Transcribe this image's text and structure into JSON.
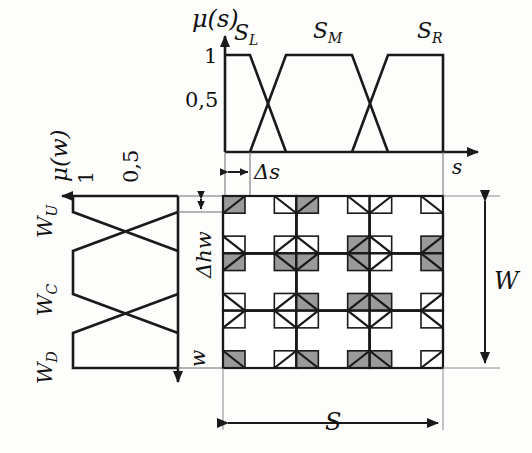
{
  "figure": {
    "background": "#fdfdfc",
    "line_color": "#1a1a1a",
    "shade_color": "#9a9a9a"
  },
  "top_plot": {
    "y_axis_label": "μ(s)",
    "x_axis_label": "s",
    "y_ticks": [
      "1",
      "0,5"
    ],
    "set_labels": [
      "S_L",
      "S_M",
      "S_R"
    ],
    "set_label_L": "S",
    "set_label_L_sub": "L",
    "set_label_M": "S",
    "set_label_M_sub": "M",
    "set_label_R": "S",
    "set_label_R_sub": "R",
    "delta_label": "Δs"
  },
  "left_plot": {
    "y_axis_label": "μ(w)",
    "x_axis_label": "w",
    "y_ticks": [
      "1",
      "0,5"
    ],
    "set_label_U": "W",
    "set_label_U_sub": "U",
    "set_label_C": "W",
    "set_label_C_sub": "C",
    "set_label_D": "W",
    "set_label_D_sub": "D",
    "delta_label": "Δhw"
  },
  "pattern": {
    "width_dim_label": "W",
    "span_dim_label": "S",
    "rows": 3,
    "cols": 3,
    "cell_type": "octagon-with-corner-squares",
    "shaded_corner_map": [
      [
        [
          1,
          0,
          0,
          0
        ],
        [
          1,
          0,
          1,
          0
        ],
        [
          0,
          0,
          1,
          0
        ]
      ],
      [
        [
          1,
          1,
          0,
          0
        ],
        [
          1,
          1,
          1,
          1
        ],
        [
          0,
          1,
          0,
          1
        ]
      ],
      [
        [
          0,
          0,
          0,
          1
        ],
        [
          0,
          0,
          1,
          1
        ],
        [
          0,
          0,
          0,
          1
        ]
      ]
    ]
  },
  "chart_data": {
    "type": "line",
    "xlabel": "s",
    "ylabel": "μ(s)",
    "ylim": [
      0,
      1
    ],
    "grid": false,
    "legend": "inline-labels",
    "series": [
      {
        "name": "S_L",
        "x": [
          0,
          22,
          60,
          60
        ],
        "y": [
          1,
          1,
          0,
          0
        ]
      },
      {
        "name": "S_M",
        "x": [
          22,
          60,
          100,
          138,
          160
        ],
        "y": [
          0,
          0,
          1,
          1,
          0
        ]
      },
      {
        "name": "S_R",
        "x": [
          100,
          138,
          176,
          200
        ],
        "y": [
          0,
          0,
          1,
          1
        ]
      }
    ],
    "series_w": [
      {
        "name": "W_U",
        "x": [
          0,
          14,
          52,
          52
        ],
        "y": [
          1,
          1,
          0,
          0
        ]
      },
      {
        "name": "W_C",
        "x": [
          14,
          52,
          92,
          130
        ],
        "y": [
          0,
          0,
          1,
          1
        ]
      },
      {
        "name": "W_D",
        "x": [
          92,
          130,
          168,
          190
        ],
        "y": [
          0,
          0,
          1,
          1
        ]
      }
    ]
  }
}
